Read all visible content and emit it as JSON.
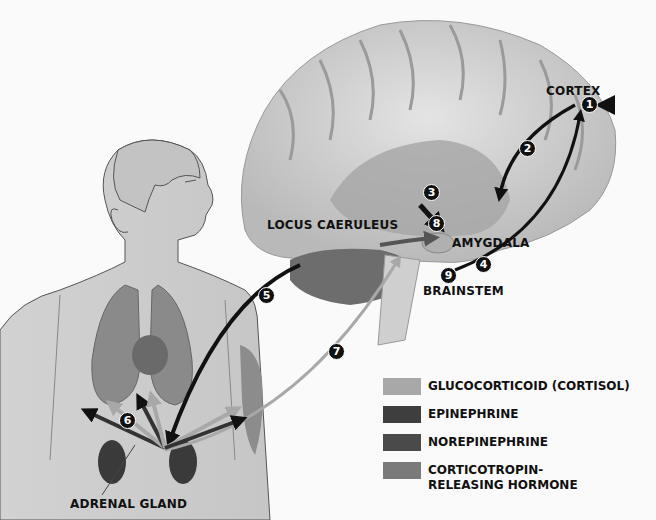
{
  "diagram": {
    "type": "stress-response-pathway",
    "labels": {
      "cortex": "CORTEX",
      "amygdala": "AMYGDALA",
      "locus_caeruleus": "LOCUS CAERULEUS",
      "brainstem": "BRAINSTEM",
      "adrenal_gland": "ADRENAL GLAND"
    },
    "steps": [
      "1",
      "2",
      "3",
      "4",
      "5",
      "6",
      "7",
      "8",
      "9"
    ],
    "legend": [
      {
        "label": "GLUCOCORTICOID (CORTISOL)",
        "color": "#a8a8a8"
      },
      {
        "label": "EPINEPHRINE",
        "color": "#3e3e3e"
      },
      {
        "label": "NOREPINEPHRINE",
        "color": "#4a4a4a"
      },
      {
        "label": "CORTICOTROPIN-RELEASING HORMONE",
        "color": "#7a7a7a"
      }
    ]
  }
}
